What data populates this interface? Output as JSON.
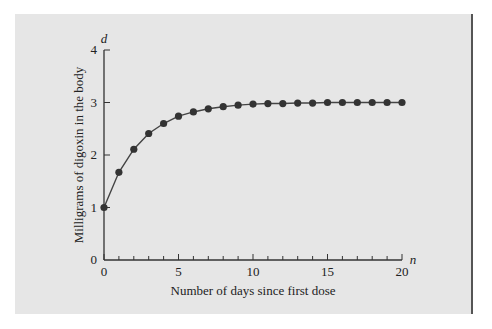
{
  "chart_data": {
    "type": "line",
    "title": "",
    "xlabel": "Number of days since first dose",
    "ylabel": "Milligrams of digoxin in the body",
    "x_var": "n",
    "y_var": "d",
    "xlim": [
      0,
      20
    ],
    "ylim": [
      0,
      4
    ],
    "x_ticks": [
      "0",
      "5",
      "10",
      "15",
      "20"
    ],
    "y_ticks": [
      "0",
      "1",
      "2",
      "3",
      "4"
    ],
    "grid": false,
    "legend": null,
    "series": [
      {
        "name": "digoxin",
        "x": [
          0,
          1,
          2,
          3,
          4,
          5,
          6,
          7,
          8,
          9,
          10,
          11,
          12,
          13,
          14,
          15,
          16,
          17,
          18,
          19,
          20
        ],
        "values": [
          1.0,
          1.67,
          2.11,
          2.41,
          2.6,
          2.74,
          2.82,
          2.88,
          2.92,
          2.95,
          2.97,
          2.98,
          2.98,
          2.99,
          2.99,
          3.0,
          3.0,
          3.0,
          3.0,
          3.0,
          3.0
        ]
      }
    ]
  }
}
